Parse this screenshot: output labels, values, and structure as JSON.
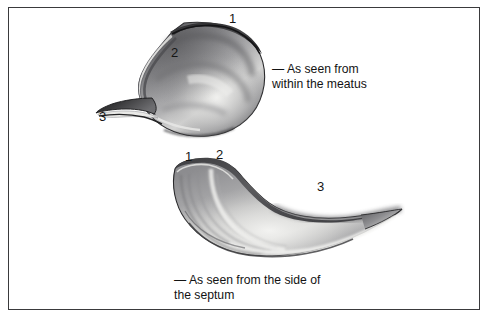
{
  "plate": {
    "background_color": "#ffffff",
    "border_color": "#3a3a3c",
    "width": 490,
    "height": 319
  },
  "figures": [
    {
      "id": "top",
      "view_caption": "— As seen from\nwithin the meatus",
      "labels": [
        {
          "text": "1",
          "position": "upper-right"
        },
        {
          "text": "2",
          "position": "upper-left"
        },
        {
          "text": "3",
          "position": "lower-left"
        }
      ]
    },
    {
      "id": "bottom",
      "view_caption": "— As seen from the side of\nthe septum",
      "labels": [
        {
          "text": "1",
          "position": "top-left"
        },
        {
          "text": "2",
          "position": "top-center-left"
        },
        {
          "text": "3",
          "position": "right"
        }
      ]
    }
  ],
  "labels": {
    "top_1": "1",
    "top_2": "2",
    "top_3": "3",
    "bottom_1": "1",
    "bottom_2": "2",
    "bottom_3": "3"
  },
  "captions": {
    "top": "— As seen from\nwithin the meatus",
    "bottom": "— As seen from the side of\nthe septum"
  },
  "colors": {
    "ink_dark": "#1d1d1f",
    "ink_mid": "#6f6f72",
    "ink_light": "#bdbdc0",
    "highlight": "#efefee",
    "border": "#3a3a3c"
  }
}
